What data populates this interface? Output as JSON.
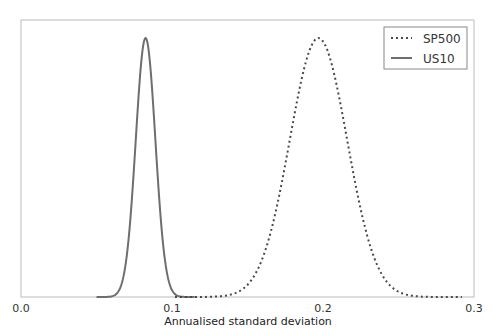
{
  "chart_data": {
    "type": "line",
    "title": "",
    "xlabel": "Annualised standard deviation",
    "ylabel": "",
    "xlim": [
      0.0,
      0.3
    ],
    "ylim": [
      0,
      1.05
    ],
    "xticks": [
      "0.0",
      "0.1",
      "0.2",
      "0.3"
    ],
    "yticks": [],
    "grid": false,
    "legend_position": "upper right",
    "series": [
      {
        "name": "SP500",
        "style": "dotted",
        "color": "#4a4a4a",
        "distribution": "density",
        "peak_x": 0.197,
        "spread_sd": 0.019,
        "x": [
          0.13,
          0.14,
          0.15,
          0.16,
          0.17,
          0.18,
          0.19,
          0.197,
          0.2,
          0.21,
          0.22,
          0.23,
          0.24,
          0.25,
          0.26
        ],
        "y": [
          0.002,
          0.01,
          0.05,
          0.15,
          0.36,
          0.67,
          0.94,
          1.0,
          0.99,
          0.83,
          0.53,
          0.25,
          0.09,
          0.02,
          0.004
        ]
      },
      {
        "name": "US10",
        "style": "solid",
        "color": "#6e6e6e",
        "distribution": "density",
        "peak_x": 0.0825,
        "spread_sd": 0.0065,
        "x": [
          0.055,
          0.06,
          0.065,
          0.07,
          0.075,
          0.08,
          0.0825,
          0.085,
          0.09,
          0.095,
          0.1,
          0.105,
          0.11
        ],
        "y": [
          0.0,
          0.01,
          0.06,
          0.24,
          0.59,
          0.93,
          1.0,
          0.93,
          0.51,
          0.16,
          0.03,
          0.003,
          0.0
        ]
      }
    ]
  },
  "legend": {
    "items": [
      {
        "label": "SP500",
        "style": "dotted"
      },
      {
        "label": "US10",
        "style": "solid"
      }
    ]
  },
  "axes": {
    "xlabel": "Annualised standard deviation",
    "xticks": [
      "0.0",
      "0.1",
      "0.2",
      "0.3"
    ]
  },
  "colors": {
    "frame": "#bcbcbc",
    "sp500": "#4a4a4a",
    "us10": "#6e6e6e"
  }
}
